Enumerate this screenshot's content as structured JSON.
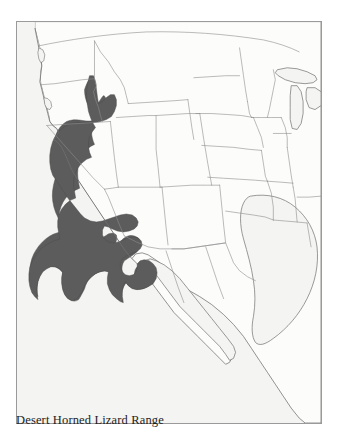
{
  "figure": {
    "caption": "Desert Horned Lizard Range",
    "frame_border_color": "#9a9a9a",
    "interior_background": "#f4f4f2",
    "page_background": "#ffffff"
  },
  "map": {
    "type": "range-distribution-map",
    "region": "Western North America",
    "projection_note": "conic",
    "land_fill": "#fcfcfb",
    "coastline_color": "#6f6f6f",
    "boundary_color": "#8d8d8d",
    "range_fill": "#5c5c5c",
    "range_outline": "#4a4a4a",
    "species": "Desert Horned Lizard",
    "range_description": "Great Basin, Mojave and Sonoran desert regions spanning eastern California, Nevada, western Utah, Arizona, southeastern Oregon, southwestern Idaho and northwestern Mexico",
    "features": [
      {
        "name": "pacific-ocean",
        "kind": "water"
      },
      {
        "name": "gulf-of-california",
        "kind": "water"
      },
      {
        "name": "gulf-of-mexico",
        "kind": "water"
      },
      {
        "name": "great-lakes",
        "kind": "water"
      },
      {
        "name": "baja-california-peninsula",
        "kind": "land"
      },
      {
        "name": "united-states-state-boundaries",
        "kind": "boundary"
      },
      {
        "name": "us-mexico-border",
        "kind": "boundary"
      },
      {
        "name": "us-canada-border",
        "kind": "boundary"
      }
    ]
  }
}
